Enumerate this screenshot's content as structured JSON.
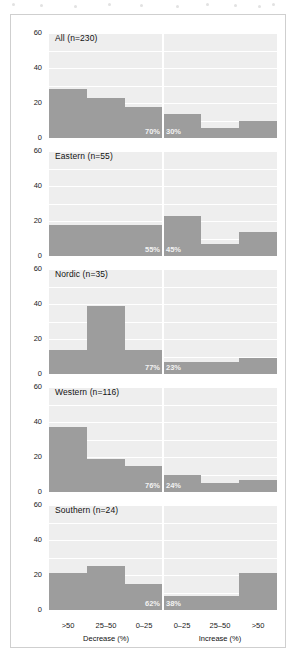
{
  "figure": {
    "ylabel": "Rivers (%)",
    "xgroups": [
      {
        "label": "Decrease (%)",
        "side": "left"
      },
      {
        "label": "Increase (%)",
        "side": "right"
      }
    ],
    "xtick_labels": [
      ">50",
      "25–50",
      "0–25",
      "0–25",
      "25–50",
      ">50"
    ],
    "ytick_labels": [
      "0",
      "20",
      "40",
      "60"
    ],
    "bar_color": "#9d9d9d",
    "panel_bg": "#eeeeee",
    "grid_color": "#ffffff",
    "frame_color": "#cfcfcf"
  },
  "chart_data": {
    "type": "bar",
    "title": "",
    "xlabel": "Decrease (%) / Increase (%)",
    "ylabel": "Rivers (%)",
    "ylim": [
      0,
      60
    ],
    "yticks": [
      0,
      20,
      40,
      60
    ],
    "grid": true,
    "legend": "none",
    "categories": [
      ">50",
      "25–50",
      "0–25",
      "0–25",
      "25–50",
      ">50"
    ],
    "category_groups": [
      "Decrease (%)",
      "Decrease (%)",
      "Decrease (%)",
      "Increase (%)",
      "Increase (%)",
      "Increase (%)"
    ],
    "panels": [
      {
        "name": "All",
        "n": 230,
        "title": "All (n=230)",
        "values": [
          28,
          23,
          18,
          14,
          6,
          10
        ],
        "annotations": [
          {
            "text": "70%",
            "side": "left"
          },
          {
            "text": "30%",
            "side": "right"
          }
        ],
        "decrease_total_pct": 70,
        "increase_total_pct": 30
      },
      {
        "name": "Eastern",
        "n": 55,
        "title": "Eastern (n=55)",
        "values": [
          18,
          18,
          18,
          23,
          7,
          14
        ],
        "annotations": [
          {
            "text": "55%",
            "side": "left"
          },
          {
            "text": "45%",
            "side": "right"
          }
        ],
        "decrease_total_pct": 55,
        "increase_total_pct": 45
      },
      {
        "name": "Nordic",
        "n": 35,
        "title": "Nordic (n=35)",
        "values": [
          14,
          39,
          14,
          7,
          7,
          9
        ],
        "annotations": [
          {
            "text": "77%",
            "side": "left"
          },
          {
            "text": "23%",
            "side": "right"
          }
        ],
        "decrease_total_pct": 77,
        "increase_total_pct": 23
      },
      {
        "name": "Western",
        "n": 116,
        "title": "Western (n=116)",
        "values": [
          37,
          19,
          15,
          10,
          5,
          7
        ],
        "annotations": [
          {
            "text": "76%",
            "side": "left"
          },
          {
            "text": "24%",
            "side": "right"
          }
        ],
        "decrease_total_pct": 76,
        "increase_total_pct": 24
      },
      {
        "name": "Southern",
        "n": 24,
        "title": "Southern (n=24)",
        "values": [
          21,
          25,
          15,
          8,
          8,
          21
        ],
        "annotations": [
          {
            "text": "62%",
            "side": "left"
          },
          {
            "text": "38%",
            "side": "right"
          }
        ],
        "decrease_total_pct": 62,
        "increase_total_pct": 38
      }
    ]
  }
}
